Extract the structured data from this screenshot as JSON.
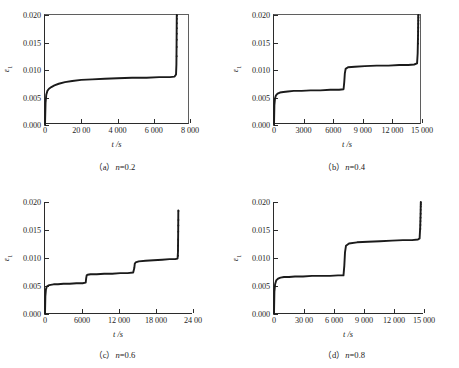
{
  "figure": {
    "type": "multi-panel-line-chart",
    "panels": 4,
    "layout": "2x2"
  },
  "chart_data": [
    {
      "type": "line",
      "panel_id": "a",
      "caption_prefix": "（a）",
      "caption_param": "n",
      "caption_value": "=0.2",
      "caption": "（a）n =0.2",
      "title": "",
      "xlabel": "t /s",
      "ylabel": "ε₁",
      "ylabel_base": "ε",
      "ylabel_sub": "1",
      "xlim": [
        0,
        8000
      ],
      "ylim": [
        0,
        0.02
      ],
      "grid": false,
      "legend": "none",
      "xticks": [
        0,
        2000,
        4000,
        6000,
        8000
      ],
      "xticklabels": [
        "0",
        "20 00",
        "4 000",
        "6 000",
        "8 000"
      ],
      "yticks": [
        0.0,
        0.005,
        0.01,
        0.015,
        0.02
      ],
      "yticklabels": [
        "0.000",
        "0.005",
        "0.010",
        "0.015",
        "0.020"
      ],
      "series": [
        {
          "name": "creep strain",
          "style": "solid-thick-dark",
          "steps": 1,
          "x": [
            0,
            30,
            70,
            130,
            220,
            350,
            520,
            760,
            1100,
            1500,
            2000,
            2600,
            3300,
            4000,
            4800,
            5600,
            6300,
            6900,
            7150,
            7230,
            7250,
            7260,
            7270
          ],
          "y": [
            0.0,
            0.004,
            0.0055,
            0.0062,
            0.0066,
            0.0069,
            0.0072,
            0.0075,
            0.0078,
            0.008,
            0.0082,
            0.0083,
            0.0084,
            0.0085,
            0.0086,
            0.0086,
            0.0087,
            0.0087,
            0.0088,
            0.0092,
            0.011,
            0.015,
            0.02
          ]
        },
        {
          "name": "failure scatter",
          "style": "dots",
          "x": [
            7265,
            7270,
            7272,
            7274,
            7276,
            7278,
            7280,
            7282
          ],
          "y": [
            0.0125,
            0.0142,
            0.0155,
            0.0166,
            0.0176,
            0.0185,
            0.0193,
            0.0199
          ]
        }
      ]
    },
    {
      "type": "line",
      "panel_id": "b",
      "caption_prefix": "（b）",
      "caption_param": "n",
      "caption_value": "=0.4",
      "caption": "（b）n=0.4",
      "title": "",
      "xlabel": "t /s",
      "ylabel": "ε₁",
      "ylabel_base": "ε",
      "ylabel_sub": "1",
      "xlim": [
        0,
        15000
      ],
      "ylim": [
        0,
        0.02
      ],
      "grid": false,
      "legend": "none",
      "xticks": [
        0,
        3000,
        6000,
        9000,
        12000,
        15000
      ],
      "xticklabels": [
        "0",
        "3000",
        "6000",
        "9 000",
        "12 000",
        "15 000"
      ],
      "yticks": [
        0.0,
        0.005,
        0.01,
        0.015,
        0.02
      ],
      "yticklabels": [
        "0.000",
        "0.005",
        "0.010",
        "0.015",
        "0.020"
      ],
      "series": [
        {
          "name": "creep strain",
          "style": "solid-thick-dark",
          "steps": 2,
          "x": [
            0,
            40,
            100,
            200,
            360,
            600,
            950,
            1400,
            2000,
            2800,
            3700,
            4700,
            5700,
            6600,
            7050,
            7120,
            7180,
            7260,
            7500,
            8200,
            9200,
            10400,
            11600,
            12700,
            13600,
            14200,
            14500,
            14560,
            14600,
            14620
          ],
          "y": [
            0.0,
            0.0036,
            0.0048,
            0.0054,
            0.0057,
            0.0059,
            0.006,
            0.0061,
            0.0062,
            0.0062,
            0.0063,
            0.0063,
            0.0064,
            0.0064,
            0.0065,
            0.0078,
            0.0094,
            0.0102,
            0.0105,
            0.0106,
            0.0107,
            0.0108,
            0.0108,
            0.0109,
            0.0109,
            0.011,
            0.0112,
            0.013,
            0.0165,
            0.02
          ]
        },
        {
          "name": "failure scatter",
          "style": "dots",
          "x": [
            14600,
            14608,
            14614,
            14620,
            14626,
            14632,
            14638,
            14644,
            14650
          ],
          "y": [
            0.0148,
            0.0156,
            0.0163,
            0.017,
            0.0177,
            0.0184,
            0.019,
            0.0195,
            0.0199
          ]
        }
      ]
    },
    {
      "type": "line",
      "panel_id": "c",
      "caption_prefix": "（c）",
      "caption_param": "n",
      "caption_value": "=0.6",
      "caption": "（c）n =0.6",
      "title": "",
      "xlabel": "t /s",
      "ylabel": "ε₁",
      "ylabel_base": "ε",
      "ylabel_sub": "1",
      "xlim": [
        0,
        24000
      ],
      "ylim": [
        0,
        0.02
      ],
      "grid": false,
      "legend": "none",
      "xticks": [
        0,
        6000,
        12000,
        18000,
        24000
      ],
      "xticklabels": [
        "0",
        "6000",
        "12 000",
        "18 000",
        "24 00"
      ],
      "yticks": [
        0.0,
        0.005,
        0.01,
        0.015,
        0.02
      ],
      "yticklabels": [
        "0.000",
        "0.005",
        "0.010",
        "0.015",
        "0.020"
      ],
      "series": [
        {
          "name": "creep strain",
          "style": "solid-thick-dark",
          "steps": 3,
          "x": [
            0,
            60,
            150,
            300,
            550,
            900,
            1400,
            2100,
            3000,
            4000,
            5100,
            6100,
            6600,
            6680,
            6760,
            6900,
            7400,
            8400,
            9600,
            10900,
            12200,
            13400,
            14300,
            14480,
            14560,
            14700,
            15200,
            16300,
            17600,
            19000,
            20200,
            21100,
            21500,
            21560,
            21600,
            21620
          ],
          "y": [
            0.0,
            0.0032,
            0.0044,
            0.0049,
            0.0051,
            0.0052,
            0.0053,
            0.0053,
            0.0054,
            0.0054,
            0.0055,
            0.0055,
            0.0056,
            0.0064,
            0.0069,
            0.007,
            0.0071,
            0.0071,
            0.0072,
            0.0072,
            0.0073,
            0.0073,
            0.0074,
            0.0082,
            0.009,
            0.0092,
            0.0094,
            0.0095,
            0.0096,
            0.0097,
            0.0098,
            0.0098,
            0.0099,
            0.011,
            0.015,
            0.0185
          ]
        },
        {
          "name": "failure scatter",
          "style": "dots",
          "x": [
            21570,
            21580,
            21590,
            21600,
            21612,
            21624,
            21636,
            21648
          ],
          "y": [
            0.0104,
            0.0113,
            0.0122,
            0.0133,
            0.0147,
            0.0158,
            0.0168,
            0.0184
          ]
        }
      ]
    },
    {
      "type": "line",
      "panel_id": "d",
      "caption_prefix": "（d）",
      "caption_param": "n",
      "caption_value": "=0.8",
      "caption": "（d）n=0.8",
      "title": "",
      "xlabel": "t /s",
      "ylabel": "ε₁",
      "ylabel_base": "ε",
      "ylabel_sub": "1",
      "xlim": [
        0,
        15000
      ],
      "ylim": [
        0,
        0.02
      ],
      "grid": false,
      "legend": "none",
      "xticks": [
        0,
        3000,
        6000,
        9000,
        12000,
        15000
      ],
      "xticklabels": [
        "0",
        "30 00",
        "6 000",
        "9 000",
        "12 000",
        "15 000"
      ],
      "yticks": [
        0.0,
        0.005,
        0.01,
        0.015,
        0.02
      ],
      "yticklabels": [
        "0.000",
        "0.005",
        "0.010",
        "0.015",
        "0.020"
      ],
      "series": [
        {
          "name": "creep strain",
          "style": "solid-thick-dark",
          "steps": 2,
          "x": [
            0,
            40,
            110,
            220,
            400,
            650,
            1000,
            1500,
            2100,
            2900,
            3800,
            4700,
            5600,
            6400,
            6950,
            7030,
            7100,
            7200,
            7500,
            8300,
            9400,
            10600,
            11800,
            12900,
            13800,
            14400,
            14560,
            14620,
            14660,
            14680
          ],
          "y": [
            0.0,
            0.004,
            0.0053,
            0.006,
            0.0063,
            0.0065,
            0.0066,
            0.0066,
            0.0067,
            0.0067,
            0.0068,
            0.0068,
            0.0068,
            0.0069,
            0.0069,
            0.0086,
            0.011,
            0.0122,
            0.0126,
            0.0128,
            0.0129,
            0.013,
            0.0131,
            0.0132,
            0.0132,
            0.0133,
            0.0135,
            0.0155,
            0.018,
            0.02
          ]
        },
        {
          "name": "failure scatter",
          "style": "dots",
          "x": [
            14640,
            14646,
            14652,
            14658,
            14664,
            14670,
            14676,
            14682,
            14688
          ],
          "y": [
            0.0152,
            0.0159,
            0.0166,
            0.0172,
            0.0179,
            0.0186,
            0.0192,
            0.0196,
            0.0199
          ]
        }
      ]
    }
  ]
}
